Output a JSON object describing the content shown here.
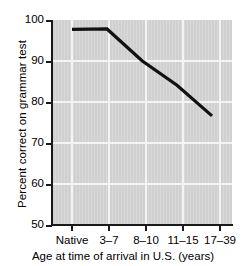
{
  "chart_data": {
    "type": "line",
    "title": "",
    "xlabel": "Age at time of arrival in U.S. (years)",
    "ylabel": "Percent correct on grammar test",
    "categories": [
      "Native",
      "3–7",
      "8–10",
      "11–15",
      "17–39"
    ],
    "values": [
      97.7,
      97.8,
      90.0,
      84.0,
      76.5
    ],
    "series": [
      {
        "name": "Percent correct on grammar test",
        "values": [
          97.7,
          97.8,
          90.0,
          84.0,
          76.5
        ]
      }
    ],
    "ylim": [
      50,
      100
    ],
    "yticks": [
      50,
      60,
      70,
      80,
      90,
      100
    ],
    "ytick_labels": [
      "50",
      "60",
      "70",
      "80",
      "90",
      "100"
    ],
    "xtick_labels": [
      "Native",
      "3–7",
      "8–10",
      "11–15",
      "17–39"
    ],
    "grid": true,
    "grid_color": "#f4f4f4",
    "plot_background": "#d2d2d2",
    "line_color": "#111111",
    "legend": "none",
    "legend_position": "none",
    "annotations": []
  }
}
